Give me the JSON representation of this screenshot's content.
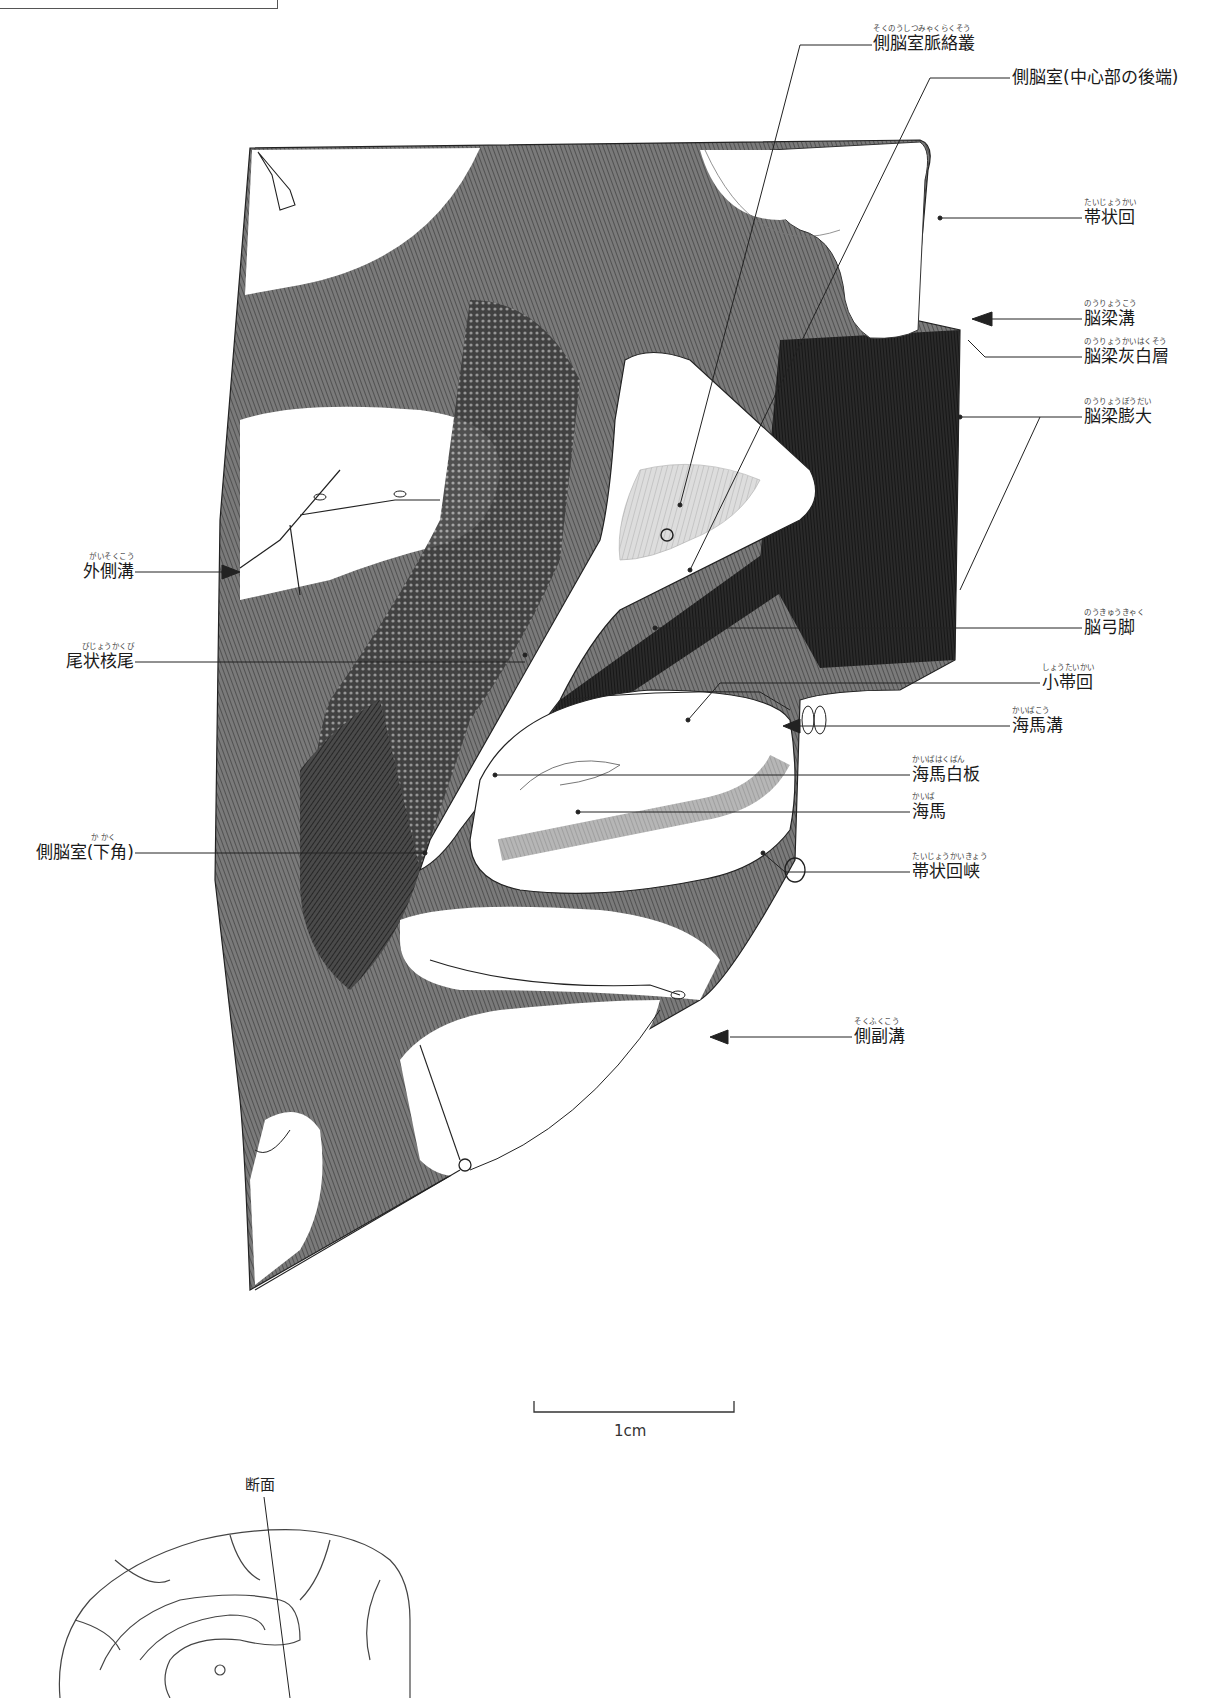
{
  "title": {
    "visible_fragment": "",
    "note_cutoff": true
  },
  "labels": {
    "choroid_plexus": {
      "ruby": "そくのうしつみゃくらくそう",
      "text": "側脳室脈絡叢"
    },
    "lateral_ventricle_central": {
      "ruby": "",
      "text": "側脳室(中心部の後端)"
    },
    "cingulate_gyrus": {
      "ruby": "たいじょうかい",
      "text": "帯状回"
    },
    "callosal_sulcus": {
      "ruby": "のうりょうこう",
      "text": "脳梁溝"
    },
    "indusium_griseum": {
      "ruby": "のうりょうかいはくそう",
      "text": "脳梁灰白層"
    },
    "splenium": {
      "ruby": "のうりょうぼうだい",
      "text": "脳梁膨大"
    },
    "lateral_sulcus": {
      "ruby": "がいそくこう",
      "text": "外側溝"
    },
    "caudate_tail": {
      "ruby": "びじょうかくび",
      "text": "尾状核尾"
    },
    "fornix_crus": {
      "ruby": "のうきゅうきゃく",
      "text": "脳弓脚"
    },
    "fasciolar_gyrus": {
      "ruby": "しょうたいかい",
      "text": "小帯回"
    },
    "hippocampal_sulcus": {
      "ruby": "かいばこう",
      "text": "海馬溝"
    },
    "alveus": {
      "ruby": "かいばはくばん",
      "text": "海馬白板"
    },
    "hippocampus": {
      "ruby": "かいば",
      "text": "海馬"
    },
    "lateral_ventricle_inferior": {
      "ruby": "か かく",
      "text": "側脳室(下角)"
    },
    "cingulate_isthmus": {
      "ruby": "たいじょうかいきょう",
      "text": "帯状回峡"
    },
    "collateral_sulcus": {
      "ruby": "そくふくこう",
      "text": "側副溝"
    }
  },
  "scale_bar": {
    "label": "1cm"
  },
  "inset": {
    "label": "断面"
  },
  "colors": {
    "ink": "#1a1a1a",
    "dark_fill": "#3a3a3a",
    "mid_fill": "#6e6e6e",
    "light_fill": "#b5b5b5",
    "paper": "#ffffff"
  }
}
